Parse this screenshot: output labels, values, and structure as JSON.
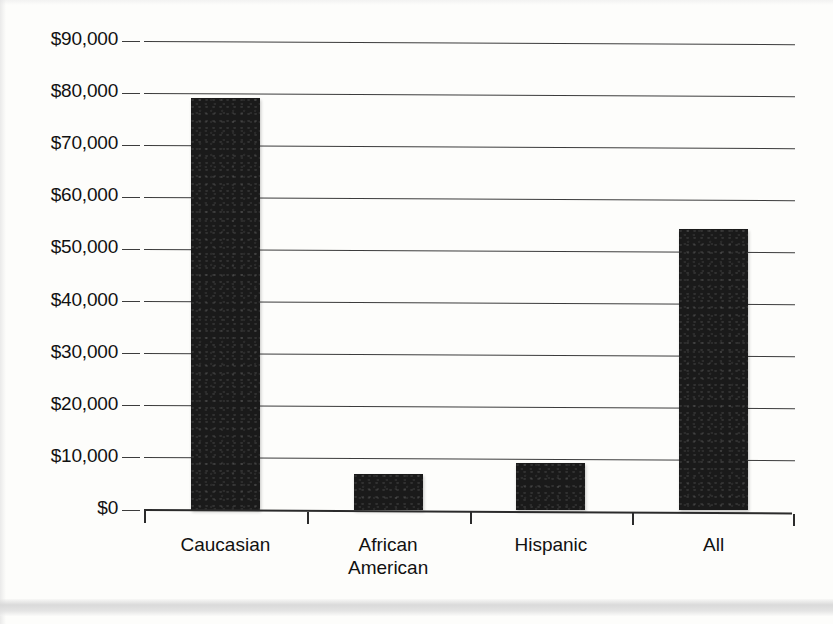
{
  "chart_data": {
    "type": "bar",
    "title": "",
    "subtitle": "",
    "xlabel": "",
    "ylabel": "",
    "categories": [
      "Caucasian",
      "African\nAmerican",
      "Hispanic",
      "All"
    ],
    "values": [
      79000,
      7000,
      9000,
      54000
    ],
    "ylim": [
      0,
      90000
    ],
    "ytick_values": [
      0,
      10000,
      20000,
      30000,
      40000,
      50000,
      60000,
      70000,
      80000,
      90000
    ],
    "ytick_labels": [
      "$0",
      "$10,000",
      "$20,000",
      "$30,000",
      "$40,000",
      "$50,000",
      "$60,000",
      "$70,000",
      "$80,000",
      "$90,000"
    ],
    "grid": true,
    "grid_axis": "y",
    "legend": false,
    "legend_position": "none",
    "bar_color": "#1a1a1a",
    "gridline_color": "#3c3c3c",
    "axis_color": "#2b2b2b",
    "background_color": "#fdfdfb",
    "annotations": []
  },
  "figure": {
    "name": "median-net-worth-bar-chart",
    "footer_band_color": "#d8d8d8"
  }
}
